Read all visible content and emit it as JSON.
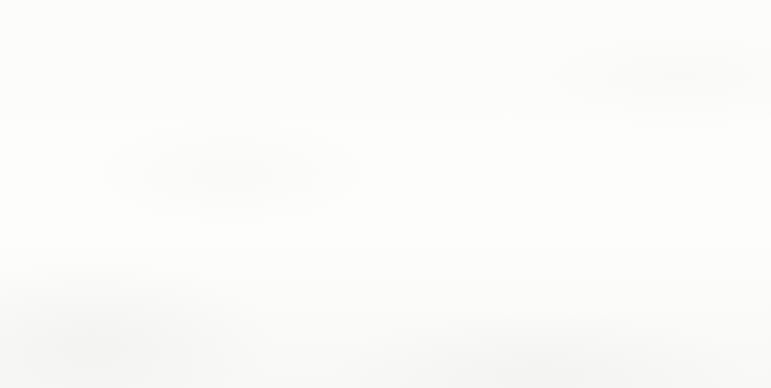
{
  "chart_data": {
    "type": "line",
    "title": "",
    "subtitle": "",
    "xlabel": "",
    "ylabel": "",
    "grid": false,
    "legend_position": "bottom",
    "categories": [
      "2004",
      "2008",
      "2012",
      "2013"
    ],
    "ylim": [
      50,
      95
    ],
    "y_axis_visible": false,
    "data_labels_shown": true,
    "series": [
      {
        "name": "Malay",
        "color": "#4F81BD",
        "marker": "diamond",
        "values": [
          58.3,
          56.3,
          61.9,
          60.6
        ],
        "labels": [
          "58.3",
          "56.3",
          "61.9",
          "60.6"
        ]
      },
      {
        "name": "Indian",
        "color": "#C0504D",
        "marker": "square",
        "values": [
          73.7,
          72.9,
          80,
          79.1
        ],
        "labels": [
          "73.7",
          "72.9",
          "80",
          "79.1"
        ]
      },
      {
        "name": "National Avg",
        "color": "#9BBB59",
        "marker": "triangle",
        "values": [
          83.2,
          83.1,
          85.3,
          85.3
        ],
        "labels": [
          "83.2",
          "83.1",
          "85.3",
          "85.3"
        ]
      },
      {
        "name": "Chinese",
        "color": "#8064A2",
        "marker": "x",
        "values": [
          89.8,
          89.6,
          90,
          90.7
        ],
        "labels": [
          "89.8",
          "89.6",
          "90",
          "90.7"
        ]
      }
    ]
  },
  "axis": {
    "line_color": "#9a9a9a",
    "tick_labels": [
      "2004",
      "2008",
      "2012",
      "2013"
    ]
  },
  "legend": {
    "items": [
      {
        "label": "Malay",
        "color": "#4F81BD",
        "marker": "diamond"
      },
      {
        "label": "Indian",
        "color": "#C0504D",
        "marker": "square"
      },
      {
        "label": "National Avg",
        "color": "#9BBB59",
        "marker": "triangle"
      },
      {
        "label": "Chinese",
        "color": "#8064A2",
        "marker": "x"
      }
    ]
  }
}
